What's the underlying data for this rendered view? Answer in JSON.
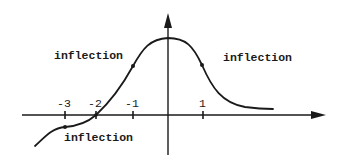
{
  "diagram": {
    "type": "function-graph",
    "axes": {
      "x_ticks": [
        {
          "label": "-3",
          "value": -3
        },
        {
          "label": "-2",
          "value": -2
        },
        {
          "label": "-1",
          "value": -1
        },
        {
          "label": "1",
          "value": 1
        }
      ]
    },
    "annotations": [
      {
        "id": "left-upper",
        "text": "inflection"
      },
      {
        "id": "right-upper",
        "text": "inflection"
      },
      {
        "id": "left-lower",
        "text": "inflection"
      }
    ],
    "colors": {
      "stroke": "#1a1a1a",
      "background": "#ffffff"
    }
  }
}
